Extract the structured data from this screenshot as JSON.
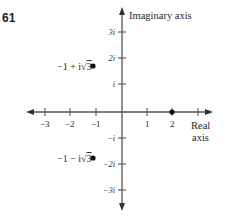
{
  "problem_number": "61",
  "axes": {
    "imaginary_label": "Imaginary axis",
    "real_label_line1": "Real",
    "real_label_line2": "axis"
  },
  "real_ticks": [
    {
      "value": -3,
      "label": "−3"
    },
    {
      "value": -2,
      "label": "−2"
    },
    {
      "value": -1,
      "label": "−1"
    },
    {
      "value": 1,
      "label": "1"
    },
    {
      "value": 2,
      "label": "2"
    },
    {
      "value": 3,
      "label": ""
    }
  ],
  "imaginary_ticks": [
    {
      "value": 3,
      "label": "3i"
    },
    {
      "value": 2,
      "label": "2i"
    },
    {
      "value": 1,
      "label": "i"
    },
    {
      "value": -1,
      "label": "−i"
    },
    {
      "value": -2,
      "label": "−2i"
    },
    {
      "value": -3,
      "label": "−3i"
    }
  ],
  "points": [
    {
      "re": -1,
      "im": 1.732,
      "label_prefix": "−1 + i",
      "label_radical": "√",
      "label_radicand": "3"
    },
    {
      "re": -1,
      "im": -1.732,
      "label_prefix": "−1 − i",
      "label_radical": "√",
      "label_radicand": "3"
    },
    {
      "re": 2,
      "im": 0,
      "label_prefix": "",
      "label_radical": "",
      "label_radicand": ""
    }
  ],
  "colors": {
    "axis": "#555555",
    "text": "#2a2a2a",
    "point": "#111111"
  }
}
